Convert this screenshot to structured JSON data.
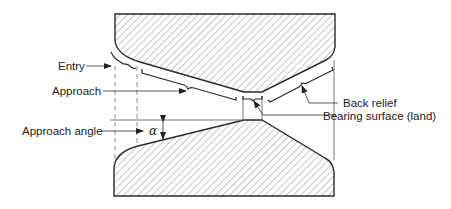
{
  "figure": {
    "type": "die cross-section diagram",
    "colors": {
      "line": "#2a2a2a",
      "hatch": "#8a8a8a",
      "text": "#222222",
      "background": "#ffffff"
    }
  },
  "labels": {
    "entry": "Entry",
    "approach": "Approach",
    "approach_angle": "Approach angle",
    "alpha_symbol": "α",
    "back_relief": "Back relief",
    "bearing_surface": "Bearing surface (land)"
  },
  "parts": {
    "top_die": "upper die half (hatched)",
    "bottom_die": "lower die half (hatched)"
  }
}
